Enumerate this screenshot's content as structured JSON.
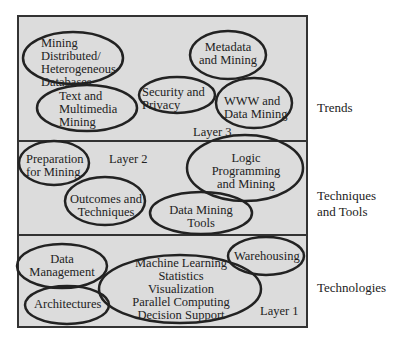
{
  "layers": [
    {
      "name": "Layer 3",
      "category": "Trends",
      "items": [
        "Mining Distributed/ Heterogeneous Databases",
        "Text and Multimedia Mining",
        "Security and Privacy",
        "Metadata and Mining",
        "WWW and Data Mining"
      ]
    },
    {
      "name": "Layer 2",
      "category": "Techniques and Tools",
      "items": [
        "Preparation for Mining",
        "Outcomes and Techniques",
        "Logic Programming and Mining",
        "Data Mining Tools"
      ]
    },
    {
      "name": "Layer 1",
      "category": "Technologies",
      "items": [
        "Data Management",
        "Architectures",
        "Machine Learning Statistics Visualization Parallel Computing Decision Support",
        "Warehousing"
      ]
    }
  ],
  "labels": {
    "l3_mining1": "Mining",
    "l3_mining2": "Distributed/",
    "l3_mining3": "Heterogeneous",
    "l3_mining4": "Databases",
    "l3_text1": "Text and",
    "l3_text2": "Multimedia",
    "l3_text3": "Mining",
    "l3_sec1": "Security and",
    "l3_sec2": "Privacy",
    "l3_meta1": "Metadata",
    "l3_meta2": "and Mining",
    "l3_www1": "WWW and",
    "l3_www2": "Data Mining",
    "l3_layer": "Layer 3",
    "l2_prep1": "Preparation",
    "l2_prep2": "for Mining",
    "l2_layer": "Layer 2",
    "l2_out1": "Outcomes and",
    "l2_out2": "Techniques",
    "l2_logic1": "Logic",
    "l2_logic2": "Programming",
    "l2_logic3": "and Mining",
    "l2_tools1": "Data Mining",
    "l2_tools2": "Tools",
    "l1_dm1": "Data",
    "l1_dm2": "Management",
    "l1_arch": "Architectures",
    "l1_ml1": "Machine Learning",
    "l1_ml2": "Statistics",
    "l1_ml3": "Visualization",
    "l1_ml4": "Parallel Computing",
    "l1_ml5": "Decision Support",
    "l1_wh": "Warehousing",
    "l1_layer": "Layer 1",
    "side_trends": "Trends",
    "side_tech1": "Techniques",
    "side_tech2": "and Tools",
    "side_technologies": "Technologies"
  }
}
